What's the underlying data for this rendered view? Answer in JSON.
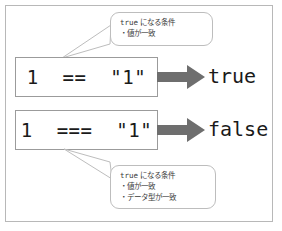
{
  "figure": {
    "colors": {
      "frame_border": "#b8b8b8",
      "box_border": "#9b9b9b",
      "callout_border": "#bdbdbd",
      "arrow_fill": "#6e6e6e",
      "text": "#1a1a1a",
      "callout_text": "#3a3a3a",
      "background": "#ffffff"
    }
  },
  "rows": [
    {
      "expression": "1  ==  \"1\"",
      "arrow": "right-block-arrow",
      "result": "true"
    },
    {
      "expression": "1  ===  \"1\"",
      "arrow": "right-block-arrow",
      "result": "false"
    }
  ],
  "callouts": {
    "top": {
      "heading_keyword": "true",
      "heading_rest": " になる条件",
      "bullets": [
        "・値が一致"
      ]
    },
    "bottom": {
      "heading_keyword": "true",
      "heading_rest": " になる条件",
      "bullets": [
        "・値が一致",
        "・データ型が一致"
      ]
    }
  }
}
